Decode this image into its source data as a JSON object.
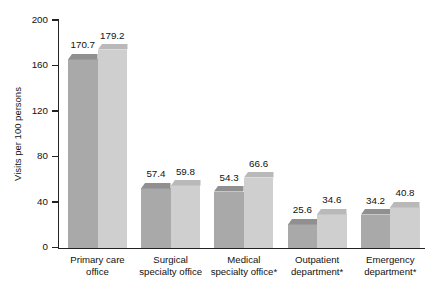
{
  "chart_data": {
    "type": "bar",
    "title": "",
    "subtitle": "",
    "xlabel": "",
    "ylabel": "Visits per 100 persons",
    "ylim": [
      0,
      200
    ],
    "yticks": [
      0,
      40,
      80,
      120,
      160,
      200
    ],
    "ytick_labels": [
      "0",
      "40",
      "80",
      "120",
      "160",
      "200"
    ],
    "grid": false,
    "legend": "none",
    "categories": [
      "Primary care office",
      "Surgical specialty office",
      "Medical specialty office*",
      "Outpatient department*",
      "Emergency department*"
    ],
    "category_lines": [
      [
        "Primary care",
        "office"
      ],
      [
        "Surgical",
        "specialty office"
      ],
      [
        "Medical",
        "specialty office*"
      ],
      [
        "Outpatient",
        "department*"
      ],
      [
        "Emergency",
        "department*"
      ]
    ],
    "series": [
      {
        "name": "series-1",
        "color": "#a8a8a8",
        "top_color": "#8f8f8f",
        "values": [
          170.7,
          59.8,
          54.3,
          25.6,
          34.2
        ],
        "value_labels": [
          "170.7",
          "59.8",
          "54.3",
          "25.6",
          "34.2"
        ]
      },
      {
        "name": "series-2",
        "color": "#cfcfcf",
        "top_color": "#bcbcbc",
        "values": [
          179.2,
          59.8,
          66.6,
          34.6,
          40.8
        ],
        "value_labels": [
          "179.2",
          "59.8",
          "66.6",
          "34.6",
          "40.8"
        ]
      }
    ],
    "bar_values_by_group": [
      {
        "category": "Primary care office",
        "left": 170.7,
        "right": 179.2
      },
      {
        "category": "Surgical specialty office",
        "left": 57.4,
        "right": 59.8
      },
      {
        "category": "Medical specialty office*",
        "left": 54.3,
        "right": 66.6
      },
      {
        "category": "Outpatient department*",
        "left": 25.6,
        "right": 34.6
      },
      {
        "category": "Emergency department*",
        "left": 34.2,
        "right": 40.8
      }
    ],
    "colors": {
      "bar_dark": "#a9a9a9",
      "bar_light": "#cfcfcf",
      "bar_dark_top": "#909090",
      "bar_light_top": "#b9b9b9",
      "axis": "#232323",
      "text": "#111111",
      "background": "#ffffff"
    }
  },
  "axis": {
    "y_title": "Visits per 100 persons"
  }
}
